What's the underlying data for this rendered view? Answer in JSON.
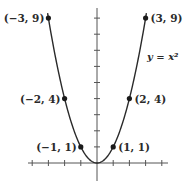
{
  "chart_data": {
    "type": "line",
    "title": "",
    "xlabel": "",
    "ylabel": "",
    "function": "y = x^2",
    "curve_label": "y = x²",
    "xlim": [
      -4,
      4
    ],
    "ylim": [
      -1,
      10
    ],
    "grid": false,
    "x_ticks": [
      -4,
      -3,
      -2,
      -1,
      1,
      2,
      3,
      4
    ],
    "y_ticks": [
      1,
      2,
      3,
      4,
      5,
      6,
      7,
      8,
      9
    ],
    "tick_labels_shown": false,
    "series": [
      {
        "name": "y = x²",
        "x": [
          -3,
          -2,
          -1,
          0,
          1,
          2,
          3
        ],
        "y": [
          9,
          4,
          1,
          0,
          1,
          4,
          9
        ]
      }
    ],
    "marked_points": [
      {
        "x": -3,
        "y": 9,
        "label": "(−3, 9)"
      },
      {
        "x": -2,
        "y": 4,
        "label": "(−2, 4)"
      },
      {
        "x": -1,
        "y": 1,
        "label": "(−1, 1)"
      },
      {
        "x": 1,
        "y": 1,
        "label": "(1, 1)"
      },
      {
        "x": 2,
        "y": 4,
        "label": "(2, 4)"
      },
      {
        "x": 3,
        "y": 9,
        "label": "(3, 9)"
      }
    ],
    "colors": {
      "curve": "#2a2a2a",
      "axes": "#555555",
      "points": "#1a1a1a"
    }
  }
}
